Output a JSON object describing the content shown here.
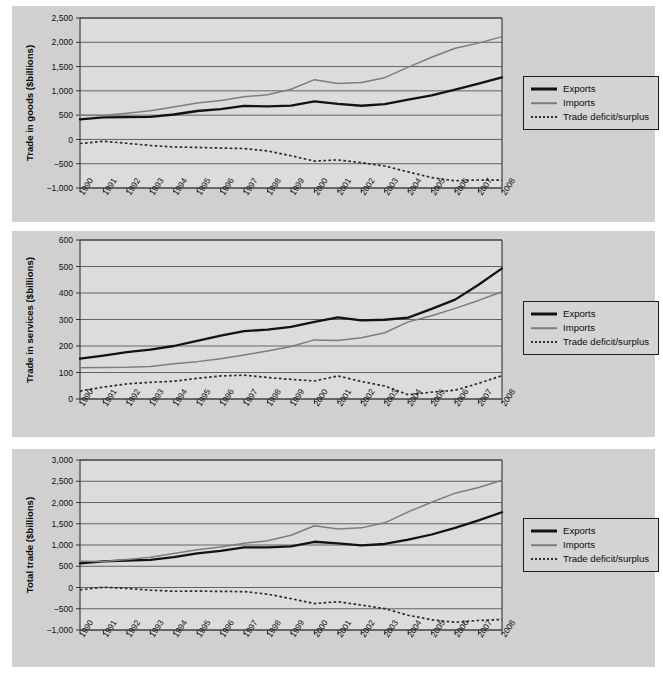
{
  "figure": {
    "background": "#ffffff",
    "panel_color": "#d0d0d0",
    "plot_color": "#dcdcdc"
  },
  "legend": {
    "items": [
      {
        "label": "Exports",
        "style": "solid-thick-black",
        "color": "#121212"
      },
      {
        "label": "Imports",
        "style": "solid-thin-gray",
        "color": "#7d7d7d"
      },
      {
        "label": "Trade deficit/surplus",
        "style": "dotted",
        "color": "#2b2b2b"
      }
    ]
  },
  "chart_data": [
    {
      "type": "line",
      "title": "",
      "xlabel": "",
      "ylabel": "Trade in goods ($billions)",
      "categories": [
        "1990",
        "1991",
        "1992",
        "1993",
        "1994",
        "1995",
        "1996",
        "1997",
        "1998",
        "1999",
        "2000",
        "2001",
        "2002",
        "2003",
        "2004",
        "2005",
        "2006",
        "2007",
        "2008"
      ],
      "ylim": [
        -1000,
        2500
      ],
      "yticks": [
        -1000,
        -500,
        0,
        500,
        1000,
        1500,
        2000,
        2500
      ],
      "ytick_labels": [
        "−1,000",
        "−500",
        "0",
        "500",
        "1,000",
        "1,500",
        "2,000",
        "2,500"
      ],
      "grid": true,
      "legend_position": "right-outside",
      "series": [
        {
          "name": "Exports",
          "values": [
            414,
            452,
            458,
            465,
            513,
            585,
            625,
            690,
            682,
            696,
            785,
            731,
            693,
            725,
            819,
            907,
            1026,
            1148,
            1277
          ]
        },
        {
          "name": "Imports",
          "values": [
            498,
            491,
            537,
            590,
            669,
            749,
            803,
            877,
            918,
            1032,
            1231,
            1153,
            1172,
            1272,
            1488,
            1693,
            1878,
            1983,
            2117
          ]
        },
        {
          "name": "Trade deficit/surplus",
          "values": [
            -84,
            -39,
            -79,
            -125,
            -156,
            -164,
            -178,
            -187,
            -236,
            -336,
            -446,
            -422,
            -479,
            -547,
            -669,
            -786,
            -852,
            -835,
            -840
          ]
        }
      ]
    },
    {
      "type": "line",
      "title": "",
      "xlabel": "",
      "ylabel": "Trade in services ($billions)",
      "categories": [
        "1990",
        "1991",
        "1992",
        "1993",
        "1994",
        "1995",
        "1996",
        "1997",
        "1998",
        "1999",
        "2000",
        "2001",
        "2002",
        "2003",
        "2004",
        "2005",
        "2006",
        "2007",
        "2008"
      ],
      "ylim": [
        0,
        600
      ],
      "yticks": [
        0,
        100,
        200,
        300,
        400,
        500,
        600
      ],
      "ytick_labels": [
        "0",
        "100",
        "200",
        "300",
        "400",
        "500",
        "600"
      ],
      "grid": true,
      "legend_position": "right-outside",
      "series": [
        {
          "name": "Exports",
          "values": [
            152,
            164,
            177,
            186,
            200,
            219,
            239,
            256,
            262,
            272,
            291,
            308,
            297,
            299,
            307,
            340,
            375,
            431,
            493
          ]
        },
        {
          "name": "Imports",
          "values": [
            118,
            119,
            120,
            123,
            133,
            141,
            152,
            166,
            181,
            198,
            223,
            221,
            231,
            250,
            291,
            314,
            342,
            372,
            405
          ]
        },
        {
          "name": "Trade deficit/surplus",
          "values": [
            30,
            45,
            57,
            63,
            67,
            78,
            87,
            90,
            81,
            74,
            68,
            87,
            66,
            49,
            16,
            26,
            33,
            59,
            88
          ]
        }
      ]
    },
    {
      "type": "line",
      "title": "",
      "xlabel": "",
      "ylabel": "Total trade ($billions)",
      "categories": [
        "1990",
        "1991",
        "1992",
        "1993",
        "1994",
        "1995",
        "1996",
        "1997",
        "1998",
        "1999",
        "2000",
        "2001",
        "2002",
        "2003",
        "2004",
        "2005",
        "2006",
        "2007",
        "2008"
      ],
      "ylim": [
        -1000,
        3000
      ],
      "yticks": [
        -1000,
        -500,
        0,
        500,
        1000,
        1500,
        2000,
        2500,
        3000
      ],
      "ytick_labels": [
        "−1,000",
        "−500",
        "0",
        "500",
        "1,000",
        "1,500",
        "2,000",
        "2,500",
        "3,000"
      ],
      "grid": true,
      "legend_position": "right-outside",
      "series": [
        {
          "name": "Exports",
          "values": [
            566,
            616,
            635,
            651,
            713,
            804,
            864,
            946,
            944,
            968,
            1076,
            1039,
            990,
            1024,
            1126,
            1247,
            1401,
            1579,
            1770
          ]
        },
        {
          "name": "Imports",
          "values": [
            616,
            610,
            657,
            713,
            802,
            890,
            955,
            1043,
            1099,
            1230,
            1454,
            1374,
            1403,
            1522,
            1779,
            2007,
            2220,
            2355,
            2522
          ]
        },
        {
          "name": "Trade deficit/surplus",
          "values": [
            -54,
            6,
            -22,
            -62,
            -89,
            -86,
            -91,
            -97,
            -155,
            -262,
            -378,
            -335,
            -413,
            -498,
            -653,
            -760,
            -819,
            -776,
            -752
          ]
        }
      ]
    }
  ]
}
